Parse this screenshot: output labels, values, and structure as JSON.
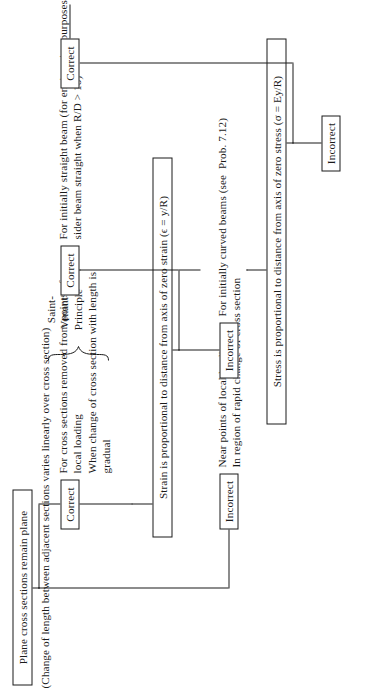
{
  "figure": {
    "type": "flowchart",
    "orientation": "rotated-90-ccw",
    "title_text": "",
    "colors": {
      "ink": "#1a1a1a",
      "paper": "#ffffff"
    }
  },
  "nodes": {
    "assumption": "Plane cross sections remain plane",
    "assumption_paren": "(Change of length between adjacent sections varies linearly over cross section)",
    "strain_statement": "Strain is proportional to distance from axis of zero strain (ϵ = y/R)",
    "stress_statement": "Stress is proportional to distance from axis of zero stress (σ = Ey/R)",
    "verdict_correct": "Correct",
    "verdict_incorrect": "Incorrect"
  },
  "branches": {
    "b1_incorrect_note": "Near points of local loading\nIn region of rapid change of cross section",
    "b1_correct_note": "For cross sections removed from points of\nlocal loading\nWhen change of cross section with length is\ngradual",
    "b2_incorrect_note": "For initially curved beams (see  Prob. 7.12)",
    "b2_correct_note": "For initially straight beam (for engineering purposes, con-\nsider beam straight when R/D > 10)",
    "b3_incorrect_note": "",
    "b3_correct_note": ""
  },
  "annotations": {
    "saint_venant": "Saint-\nVenant's\nPrinciple"
  },
  "chain": [
    {
      "id": "assumption",
      "label": "Plane cross sections remain plane",
      "kind": "statement"
    },
    {
      "id": "v1_incorrect",
      "label": "Incorrect",
      "kind": "verdict"
    },
    {
      "id": "v1_correct",
      "label": "Correct",
      "kind": "verdict"
    },
    {
      "id": "strain",
      "label": "Strain is proportional to distance from axis of zero strain (ϵ = y/R)",
      "kind": "statement"
    },
    {
      "id": "v2_incorrect",
      "label": "Incorrect",
      "kind": "verdict"
    },
    {
      "id": "v2_correct",
      "label": "Correct",
      "kind": "verdict"
    },
    {
      "id": "stress",
      "label": "Stress is proportional to distance from axis of zero stress (σ = Ey/R)",
      "kind": "statement"
    },
    {
      "id": "v3_incorrect",
      "label": "Incorrect",
      "kind": "verdict"
    },
    {
      "id": "v3_correct",
      "label": "Correct",
      "kind": "verdict"
    }
  ]
}
